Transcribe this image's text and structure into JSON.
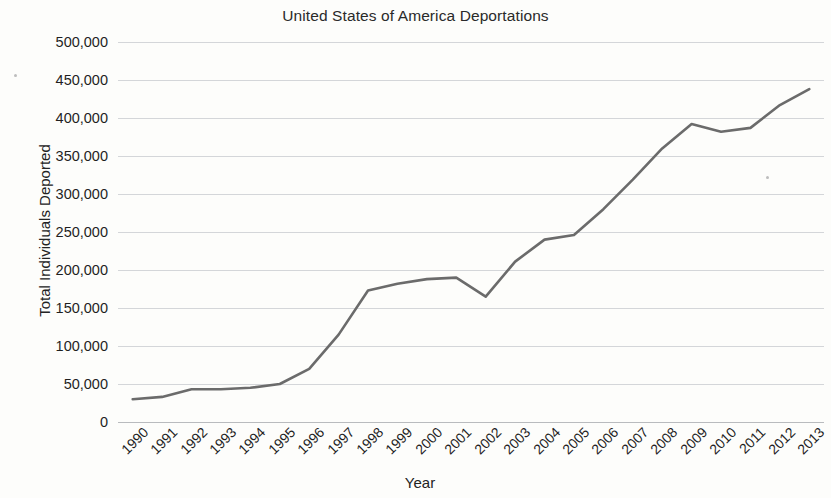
{
  "chart_data": {
    "type": "line",
    "title": "United States of America Deportations",
    "xlabel": "Year",
    "ylabel": "Total Individuals Deported",
    "x": [
      1990,
      1991,
      1992,
      1993,
      1994,
      1995,
      1996,
      1997,
      1998,
      1999,
      2000,
      2001,
      2002,
      2003,
      2004,
      2005,
      2006,
      2007,
      2008,
      2009,
      2010,
      2011,
      2012,
      2013
    ],
    "categories": [
      "1990",
      "1991",
      "1992",
      "1993",
      "1994",
      "1995",
      "1996",
      "1997",
      "1998",
      "1999",
      "2000",
      "2001",
      "2002",
      "2003",
      "2004",
      "2005",
      "2006",
      "2007",
      "2008",
      "2009",
      "2010",
      "2011",
      "2012",
      "2013"
    ],
    "values": [
      30000,
      33000,
      43000,
      43000,
      45000,
      50000,
      70000,
      115000,
      173000,
      182000,
      188000,
      190000,
      165000,
      211000,
      240000,
      246000,
      280000,
      319000,
      360000,
      392000,
      382000,
      387000,
      417000,
      438000
    ],
    "series": [
      {
        "name": "Total Individuals Deported",
        "color": "#6b6b6b",
        "values": [
          30000,
          33000,
          43000,
          43000,
          45000,
          50000,
          70000,
          115000,
          173000,
          182000,
          188000,
          190000,
          165000,
          211000,
          240000,
          246000,
          280000,
          319000,
          360000,
          392000,
          382000,
          387000,
          417000,
          438000
        ]
      }
    ],
    "ylim": [
      0,
      500000
    ],
    "ytick_values": [
      500000,
      450000,
      400000,
      350000,
      300000,
      250000,
      200000,
      150000,
      100000,
      50000,
      0
    ],
    "ytick_labels": [
      "500,000",
      "450,000",
      "400,000",
      "350,000",
      "300,000",
      "250,000",
      "200,000",
      "150,000",
      "100,000",
      "50,000",
      "0"
    ],
    "grid": true,
    "grid_axis": "y",
    "legend": false,
    "legend_position": "none",
    "xtick_rotation": -45,
    "markers": false
  },
  "style": {
    "background": "#fdfdfb",
    "line_color": "#6b6b6b",
    "grid_color": "#d4d6d9",
    "axis_color": "#b9bbbe",
    "text_color": "#1f1f1f",
    "line_width": 2.6
  }
}
